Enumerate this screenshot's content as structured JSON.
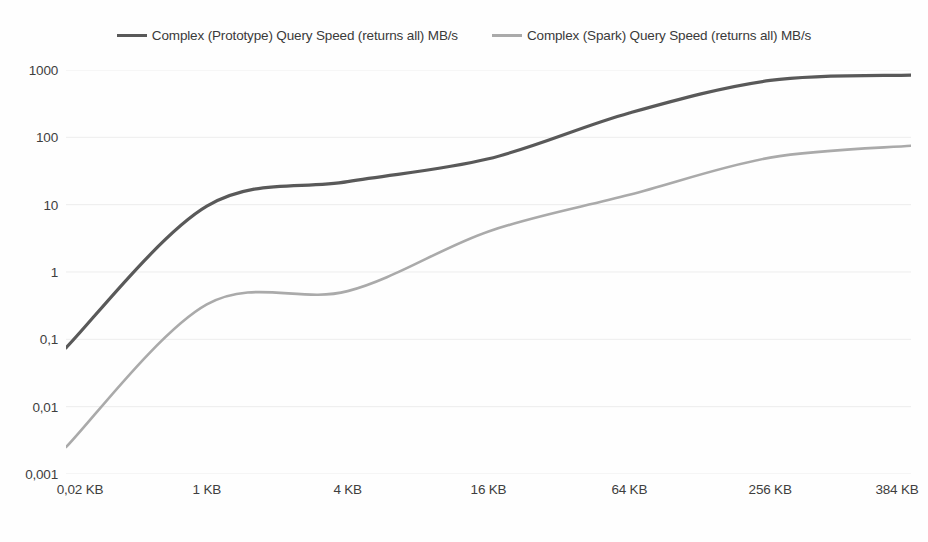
{
  "chart_data": {
    "type": "line",
    "title": "",
    "subtitle": "",
    "xlabel": "",
    "ylabel": "",
    "yscale": "log",
    "ylim": [
      0.001,
      1000
    ],
    "grid": true,
    "legend_position": "top-center",
    "categories": [
      "0,02 KB",
      "1 KB",
      "4 KB",
      "16 KB",
      "64 KB",
      "256 KB",
      "384 KB"
    ],
    "y_ticks": [
      "1000",
      "100",
      "10",
      "1",
      "0,1",
      "0,01",
      "0,001"
    ],
    "y_tick_values": [
      1000,
      100,
      10,
      1,
      0.1,
      0.01,
      0.001
    ],
    "series": [
      {
        "name": "Complex (Prototype) Query Speed (returns all) MB/s",
        "color": "#595959",
        "values": [
          0.075,
          9.5,
          22,
          48,
          230,
          700,
          840
        ]
      },
      {
        "name": "Complex (Spark) Query Speed (returns all) MB/s",
        "color": "#aaaaaa",
        "values": [
          0.0025,
          0.33,
          0.52,
          4.0,
          14,
          50,
          75
        ]
      }
    ]
  },
  "legend": {
    "items": [
      {
        "label": "Complex (Prototype) Query Speed (returns all) MB/s",
        "color": "#595959"
      },
      {
        "label": "Complex (Spark) Query Speed (returns all) MB/s",
        "color": "#aaaaaa"
      }
    ]
  },
  "style": {
    "background": "#fefefe",
    "gridline_color": "#ededed",
    "text_color": "#3f3f3f"
  }
}
